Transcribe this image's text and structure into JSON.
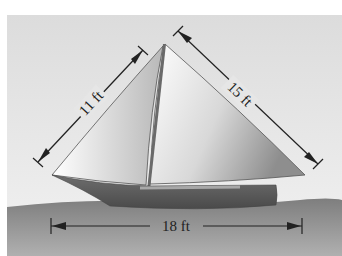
{
  "figure": {
    "labels": {
      "jib_edge": "11 ft",
      "main_edge": "15 ft",
      "base": "18 ft"
    },
    "colors": {
      "sky": "#e6e6e6",
      "sea": "#8c8c8c",
      "hull": "#5a5a5a",
      "sail_light": "#ffffff",
      "sail_dark": "#9a9a9a",
      "dimension_line": "#222222"
    }
  }
}
